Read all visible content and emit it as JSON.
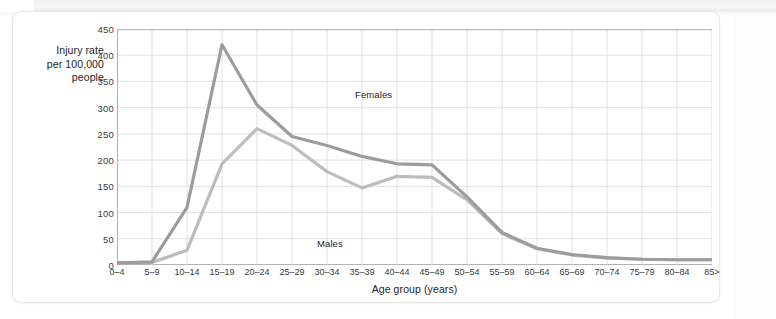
{
  "figure": {
    "background_color": "#ffffff",
    "border_color": "#e6e6e6"
  },
  "chart_data": {
    "type": "line",
    "title": "",
    "xlabel": "Age group (years)",
    "ylabel": "Injury rate per 100,000 people",
    "ylabel_lines": [
      "Injury rate",
      "per 100,000",
      "people"
    ],
    "ylim": [
      0,
      450
    ],
    "yticks": [
      0,
      50,
      100,
      150,
      200,
      250,
      300,
      350,
      400,
      450
    ],
    "grid": true,
    "legend_position": "inline-annotation",
    "categories": [
      "0–4",
      "5–9",
      "10–14",
      "15–19",
      "20–24",
      "25–29",
      "30–34",
      "35–39",
      "40–44",
      "45–49",
      "50–54",
      "55–59",
      "60–64",
      "65–69",
      "70–74",
      "75–79",
      "80–84",
      "85>"
    ],
    "series": [
      {
        "name": "Females",
        "color": "#9c9c9c",
        "values": [
          4,
          6,
          110,
          420,
          305,
          245,
          228,
          207,
          193,
          191,
          130,
          62,
          32,
          20,
          14,
          11,
          10,
          10
        ]
      },
      {
        "name": "Males",
        "color": "#bdbdbd",
        "values": [
          4,
          5,
          28,
          193,
          260,
          228,
          178,
          147,
          169,
          167,
          124,
          60,
          31,
          19,
          13,
          11,
          10,
          10
        ]
      }
    ],
    "annotations": [
      {
        "text": "Females",
        "category": "20–24",
        "value": 375
      },
      {
        "text": "Males",
        "category": "12–14",
        "value": 70
      }
    ]
  }
}
